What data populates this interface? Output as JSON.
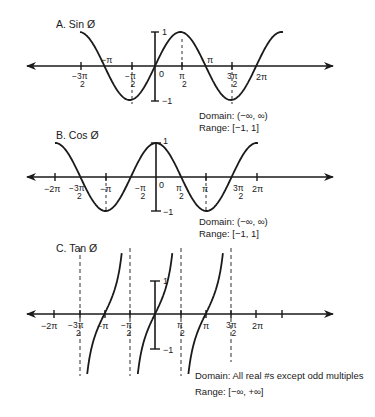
{
  "graphs": [
    {
      "id": "sin",
      "title": "A. Sin Ø",
      "domain_text": "Domain: (−∞, ∞)",
      "range_text": "Range: [−1, 1]",
      "y_tick_top": "1",
      "y_tick_bottom": "−1",
      "origin_label": "0",
      "x_labels": {
        "neg_3pi_2": {
          "num": "−3π",
          "den": "2"
        },
        "neg_pi": "−π",
        "neg_pi_2": {
          "num": "−π",
          "den": "2"
        },
        "pi_2": {
          "num": "π",
          "den": "2"
        },
        "pi": "π",
        "three_pi_2": {
          "num": "3π",
          "den": "2"
        },
        "two_pi": "2π"
      }
    },
    {
      "id": "cos",
      "title": "B. Cos Ø",
      "domain_text": "Domain: (−∞, ∞)",
      "range_text": "Range: [−1, 1]",
      "y_tick_top": "1",
      "y_tick_bottom": "−1",
      "origin_label": "0",
      "x_labels": {
        "neg_2pi": "−2π",
        "neg_3pi_2": {
          "num": "−3π",
          "den": "2"
        },
        "neg_pi": "−π",
        "neg_pi_2": {
          "num": "−π",
          "den": "2"
        },
        "pi_2": {
          "num": "π",
          "den": "2"
        },
        "pi": "π",
        "three_pi_2": {
          "num": "3π",
          "den": "2"
        },
        "two_pi": "2π"
      }
    },
    {
      "id": "tan",
      "title": "C. Tan Ø",
      "domain_text": "Domain: All real #s except odd multiples",
      "range_text": "Range: [−∞, +∞]",
      "y_tick_top": "1",
      "y_tick_bottom": "−1",
      "x_labels": {
        "neg_2pi": "−2π",
        "neg_3pi_2": {
          "num": "−3π",
          "den": "2"
        },
        "neg_pi": "−π",
        "neg_pi_2": {
          "num": "−π",
          "den": "2"
        },
        "pi_2": {
          "num": "π",
          "den": "2"
        },
        "pi": "π",
        "three_pi_2": {
          "num": "3π",
          "den": "2"
        },
        "two_pi": "2π"
      }
    }
  ],
  "colors": {
    "ink": "#1a1a1a",
    "background": "#ffffff"
  }
}
